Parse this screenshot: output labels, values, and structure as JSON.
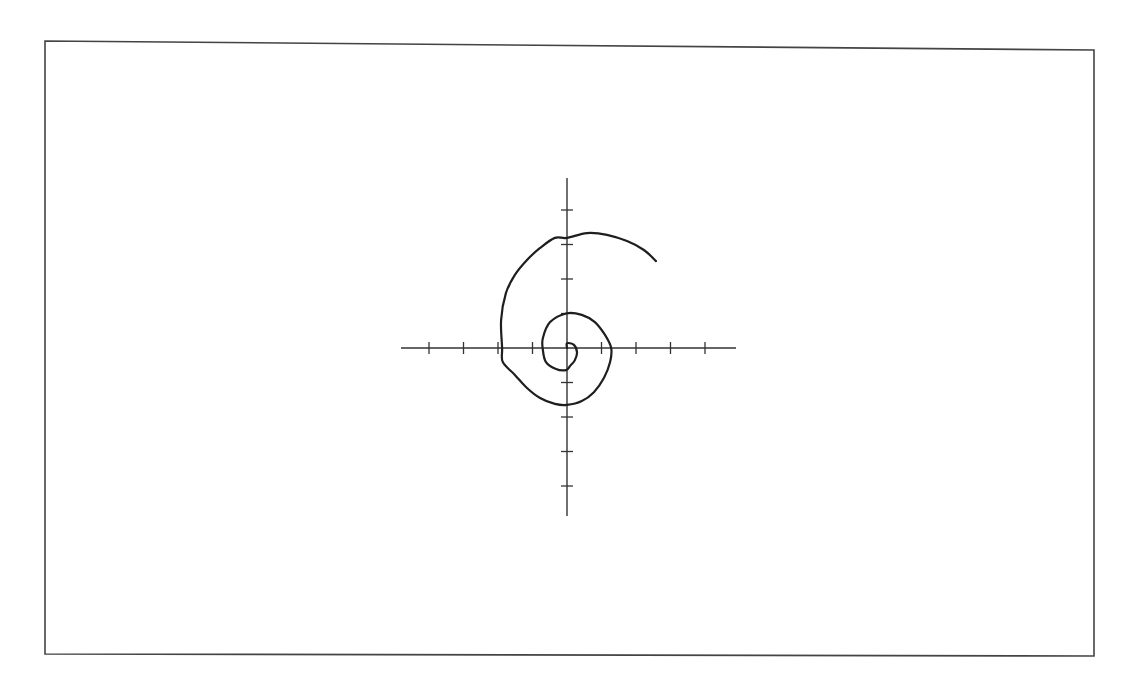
{
  "chart_data": {
    "type": "line",
    "title": "",
    "subtitle": "",
    "xlabel": "",
    "ylabel": "",
    "grid": false,
    "legend": null,
    "tick_labels": {
      "x": [],
      "y": []
    },
    "xlim": [
      -5,
      5
    ],
    "ylim": [
      -5,
      5
    ],
    "x_ticks": [
      -4,
      -3,
      -2,
      -1,
      1,
      2,
      3,
      4
    ],
    "y_ticks": [
      -4,
      -3,
      -2,
      -1,
      1,
      2,
      3,
      4
    ],
    "tick_spacing_units": 1,
    "series": [
      {
        "name": "spiral",
        "color": "#1e1e1e",
        "points_xy_units": [
          [
            0.0,
            0.0
          ],
          [
            0.0,
            0.14
          ],
          [
            0.2,
            0.09
          ],
          [
            0.29,
            -0.12
          ],
          [
            0.23,
            -0.35
          ],
          [
            0.09,
            -0.52
          ],
          [
            -0.03,
            -0.64
          ],
          [
            -0.32,
            -0.61
          ],
          [
            -0.61,
            -0.41
          ],
          [
            -0.7,
            -0.06
          ],
          [
            -0.7,
            0.29
          ],
          [
            -0.49,
            0.75
          ],
          [
            0.0,
            1.01
          ],
          [
            0.43,
            0.96
          ],
          [
            0.81,
            0.75
          ],
          [
            1.1,
            0.38
          ],
          [
            1.28,
            0.0
          ],
          [
            1.25,
            -0.41
          ],
          [
            1.07,
            -0.87
          ],
          [
            0.78,
            -1.28
          ],
          [
            0.43,
            -1.54
          ],
          [
            0.0,
            -1.65
          ],
          [
            -0.35,
            -1.62
          ],
          [
            -0.78,
            -1.45
          ],
          [
            -1.16,
            -1.16
          ],
          [
            -1.51,
            -0.78
          ],
          [
            -1.86,
            -0.41
          ],
          [
            -1.88,
            0.0
          ],
          [
            -1.91,
            0.81
          ],
          [
            -1.77,
            1.59
          ],
          [
            -1.51,
            2.12
          ],
          [
            -1.16,
            2.55
          ],
          [
            -0.78,
            2.9
          ],
          [
            -0.35,
            3.19
          ],
          [
            0.0,
            3.19
          ],
          [
            0.58,
            3.33
          ],
          [
            1.16,
            3.28
          ],
          [
            1.74,
            3.1
          ],
          [
            2.23,
            2.84
          ],
          [
            2.58,
            2.52
          ]
        ]
      }
    ],
    "axis_crossings_units": {
      "left_inner": -0.7,
      "top_inner": 1.01,
      "right": 1.28,
      "bottom": -1.65,
      "left_outer": -1.88,
      "top_outer": 3.19
    },
    "end_point_units": [
      2.58,
      2.52
    ]
  },
  "layout": {
    "frame": {
      "x1": 45,
      "y1": 41,
      "x2": 1094,
      "y2": 50,
      "x3": 1094,
      "y4": 654,
      "x4": 45,
      "y3": 656
    },
    "origin_px": [
      567,
      348
    ],
    "unit_px": 34.5,
    "x_axis_px": [
      401,
      736
    ],
    "y_axis_px": [
      178,
      516
    ]
  }
}
